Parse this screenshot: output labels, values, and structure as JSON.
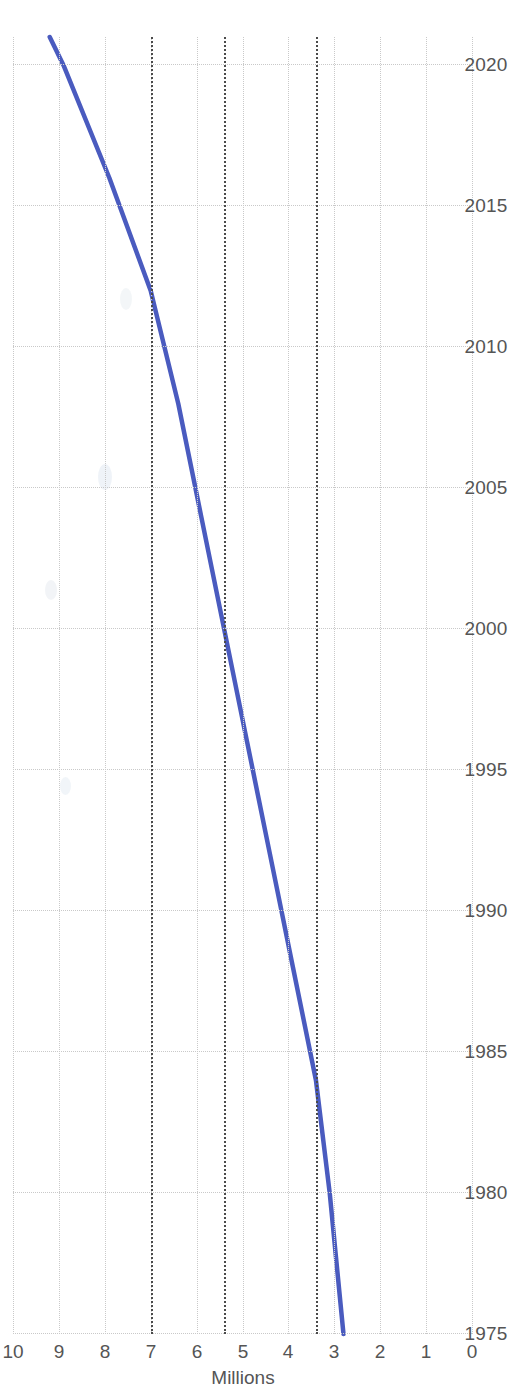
{
  "chart_data": {
    "type": "line",
    "title": "",
    "subtitle": "",
    "xlabel": "",
    "ylabel": "Millions",
    "orientation_note": "rotated-90",
    "xlim": [
      1975,
      2021
    ],
    "ylim": [
      0,
      10
    ],
    "grid": true,
    "legend": "none",
    "x_tick_labels": [
      "1975",
      "1980",
      "1985",
      "1990",
      "1995",
      "2000",
      "2005",
      "2010",
      "2015",
      "2020"
    ],
    "x_ticks": [
      1975,
      1980,
      1985,
      1990,
      1995,
      2000,
      2005,
      2010,
      2015,
      2020
    ],
    "y_tick_labels": [
      "0",
      "1",
      "2",
      "3",
      "4",
      "5",
      "6",
      "7",
      "8",
      "9",
      "10"
    ],
    "y_ticks": [
      0,
      1,
      2,
      3,
      4,
      5,
      6,
      7,
      8,
      9,
      10
    ],
    "series": [
      {
        "name": "Millions",
        "color": "#4a5bbf",
        "x": [
          1975,
          1980,
          1984,
          1988,
          1992,
          1996,
          2000,
          2004,
          2008,
          2012,
          2016,
          2020,
          2021
        ],
        "values": [
          2.8,
          3.1,
          3.4,
          3.9,
          4.4,
          4.9,
          5.4,
          5.9,
          6.4,
          7.0,
          7.9,
          8.9,
          9.2
        ]
      }
    ],
    "annotations": [
      {
        "name": "reference-line-1984",
        "type": "horizontal-reference",
        "x": 1984,
        "y": 3.4,
        "style": "dotted"
      },
      {
        "name": "reference-line-2000",
        "type": "horizontal-reference",
        "x": 2000,
        "y": 5.4,
        "style": "dotted"
      },
      {
        "name": "reference-line-2012",
        "type": "horizontal-reference",
        "x": 2012,
        "y": 7.0,
        "style": "dotted"
      }
    ]
  },
  "axis": {
    "y_title": "Millions"
  }
}
